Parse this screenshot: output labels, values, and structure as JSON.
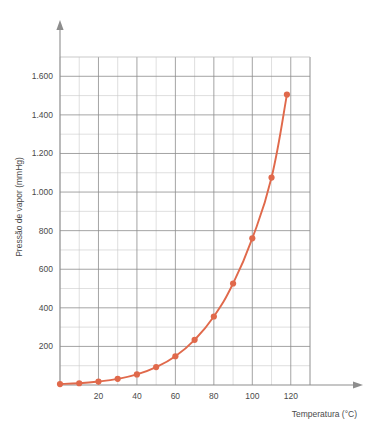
{
  "chart_data": {
    "type": "line",
    "title": "",
    "xlabel": "Temperatura (°C)",
    "ylabel": "Pressão de vapor (mmHg)",
    "xlim": [
      0,
      130
    ],
    "ylim": [
      0,
      1700
    ],
    "grid": true,
    "legend": false,
    "series": [
      {
        "name": "Pressão de vapor da água",
        "color": "#e0694b",
        "marker": "circle",
        "x": [
          0,
          10,
          20,
          30,
          40,
          50,
          60,
          70,
          80,
          90,
          100,
          110,
          118
        ],
        "values": [
          5,
          9,
          18,
          32,
          55,
          93,
          149,
          234,
          355,
          526,
          760,
          1075,
          1505
        ]
      }
    ],
    "x_tick_labels": [
      "20",
      "40",
      "60",
      "80",
      "100",
      "120"
    ],
    "x_tick_values": [
      20,
      40,
      60,
      80,
      100,
      120
    ],
    "x_minor_step": 10,
    "y_tick_labels": [
      "200",
      "400",
      "600",
      "800",
      "1.000",
      "1.200",
      "1.400",
      "1.600"
    ],
    "y_tick_values": [
      200,
      400,
      600,
      800,
      1000,
      1200,
      1400,
      1600
    ],
    "y_minor_step": 100,
    "axis_color": "#8d8d8d",
    "grid_minor_color": "#c9c9c9",
    "grid_major_color": "#8d8d8d",
    "accent_color": "#e0694b"
  }
}
